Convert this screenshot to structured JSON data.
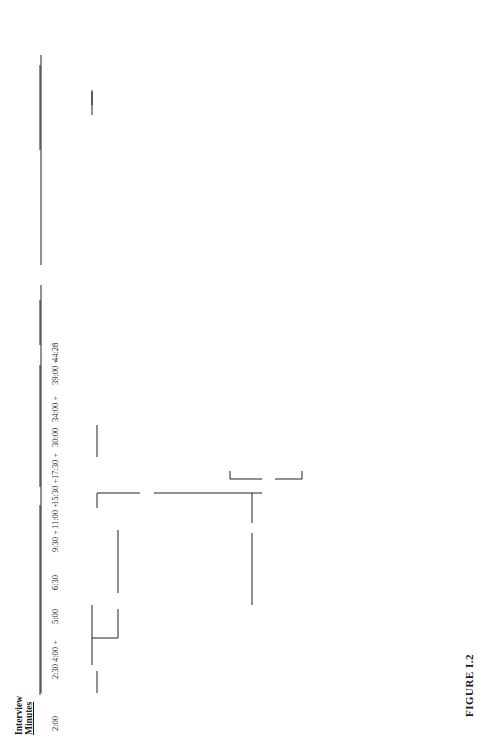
{
  "figure": {
    "caption": "FIGURE I.2",
    "timeline_header": [
      "Interview",
      "Minutes"
    ],
    "hypotheses_header": "Hypotheses",
    "timeline": [
      "2:00",
      "2:30",
      "4:00 +",
      "5:00",
      "6:30",
      "9:30 +",
      "11:00 +",
      "15:30 +",
      "17:30 +",
      "30:00",
      "34:00 +",
      "39:00 +",
      "44:28"
    ],
    "nodes": {
      "malingering_start": "Malingering",
      "malingering_discard": "(discard)",
      "malingering_end": "Malingering",
      "malingering_test": "(test)",
      "paranoid_reaction": [
        "Paranoid",
        "Reaction"
      ],
      "vs_paranoid": "vs.",
      "schizophrenia_top": "Schizophrenia",
      "paranoid_schizophrenia_1": [
        "Paranoid",
        "Schizophrenia"
      ],
      "paranoid_schizophrenic_reaction": [
        "Paranoid",
        "Schizophrenic",
        "Reaction"
      ],
      "paranoid_schizophrenia_partial": [
        "Paranoid",
        "Schizophrenia",
        "(partial closure",
        "on this as diagnosis)"
      ],
      "proposed_management": "(Proposed Management)",
      "paranoid_schizophrenia_2": [
        "Paranoid",
        "Schizophrenia"
      ],
      "family_related": [
        "Family-Related",
        "Delusional Scheme",
        "(dynamic formulation)"
      ],
      "major_affective": [
        "Major Affective",
        "Disorder"
      ],
      "major_affective_discard": "(discard)",
      "schizophrenia_mid": "Schizophrenia",
      "schizophrenic_reaction": [
        "Schizophrenic",
        "Reaction"
      ],
      "paranoid_schizophrenia_chronic": [
        "PARANOID",
        "SCHIZOPHRENIA,",
        "CHRONIC"
      ],
      "management_strategy": "Management Strategy",
      "vs_ps_pt": "vs.",
      "posttoxic_schizophreniform": [
        "Posttoxic",
        "Schizophreniform",
        "State"
      ],
      "vs_schizo": "vs.",
      "posttoxic_psychosis": [
        "Posttoxic",
        "Psychosis"
      ],
      "plus_1": "+",
      "toxic_factors": "+ Toxic Factors",
      "toxic_rule_out": "(rule out by tests)",
      "hallucinosis": "Hallucinosis",
      "other_organic": [
        "Other",
        "Organic",
        "Syndromes"
      ],
      "posttoxic_state": [
        "Posttoxic",
        "State"
      ],
      "vs_posttoxic": "vs.",
      "amphetamine_psychosis": [
        "Amphetamine",
        "Psychosis"
      ],
      "amphetamine_discard": "(discard)",
      "organic_mental": [
        "Organic",
        "Mental",
        "Syndrome"
      ],
      "vs_organic": "vs.",
      "delirium": "Delirium",
      "delirium_discard": "(discard)",
      "organic_factors": [
        "+ Organic",
        "Factors"
      ],
      "organic_rule_out": "(rule out by tests)"
    }
  }
}
